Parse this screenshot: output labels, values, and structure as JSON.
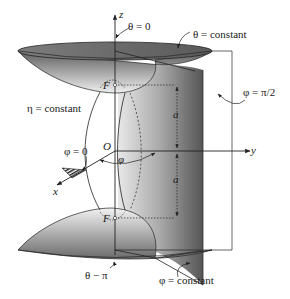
{
  "figure": {
    "labels": {
      "z_axis": "z",
      "y_axis": "y",
      "x_axis": "x",
      "origin": "O",
      "focus_top": "F",
      "focus_bottom": "F",
      "theta_zero": "θ = 0",
      "theta_const": "θ = constant",
      "phi_half_pi": "φ = π/2",
      "eta_const": "η = constant",
      "phi_zero": "φ = 0",
      "phi_angle": "φ",
      "a_upper": "a",
      "a_lower": "a",
      "theta_pi": "θ − π",
      "phi_const": "φ = constant"
    },
    "colors": {
      "stroke": "#222222",
      "surface_dark": "#6a6a6a",
      "surface_mid": "#9a9a9a",
      "surface_light": "#e4e4e4",
      "plane_dark": "#5e5e5e",
      "plane_light": "#c8c8c8",
      "background": "#ffffff"
    }
  }
}
